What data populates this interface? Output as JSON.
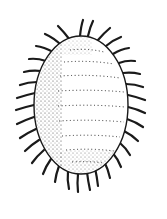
{
  "figure": {
    "style": "stipple line drawing",
    "colors": {
      "ink": "#1a1a1a",
      "background": "#ffffff"
    }
  }
}
